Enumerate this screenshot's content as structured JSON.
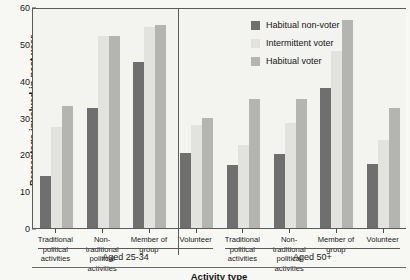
{
  "chart_data": {
    "type": "bar",
    "title": "",
    "xlabel": "Activity type",
    "ylabel": "Percentage involved in past year",
    "ylim": [
      0,
      60
    ],
    "yticks": [
      0,
      10,
      20,
      30,
      40,
      50,
      60
    ],
    "grid": false,
    "legend_position": "top-right-inside",
    "categories": [
      "Traditional political activities",
      "Non-traditional political activities",
      "Member of group",
      "Volunteer"
    ],
    "category_lines": [
      [
        "Traditional",
        "political",
        "activities"
      ],
      [
        "Non-",
        "traditional",
        "political",
        "activities"
      ],
      [
        "Member of",
        "group"
      ],
      [
        "Volunteer"
      ]
    ],
    "panels": [
      {
        "label": "Aged 25-34",
        "series": [
          {
            "name": "Habitual non-voter",
            "values": [
              14,
              32.5,
              45,
              20.5
            ]
          },
          {
            "name": "Intermittent voter",
            "values": [
              27.5,
              52,
              54.5,
              28
            ]
          },
          {
            "name": "Habitual voter",
            "values": [
              33,
              52,
              55,
              30
            ]
          }
        ]
      },
      {
        "label": "Aged 50+",
        "series": [
          {
            "name": "Habitual non-voter",
            "values": [
              17,
              20,
              38,
              17.5
            ]
          },
          {
            "name": "Intermittent voter",
            "values": [
              22.5,
              28.5,
              48,
              24
            ]
          },
          {
            "name": "Habitual voter",
            "values": [
              35,
              35,
              56.5,
              32.5
            ]
          }
        ]
      }
    ],
    "series_colors": [
      "#6f6f6f",
      "#e2e2de",
      "#b4b4b0"
    ],
    "legend": [
      {
        "label": "Habitual non-voter",
        "color": "#6f6f6f"
      },
      {
        "label": "Intermittent voter",
        "color": "#e2e2de"
      },
      {
        "label": "Habitual voter",
        "color": "#b4b4b0"
      }
    ]
  }
}
